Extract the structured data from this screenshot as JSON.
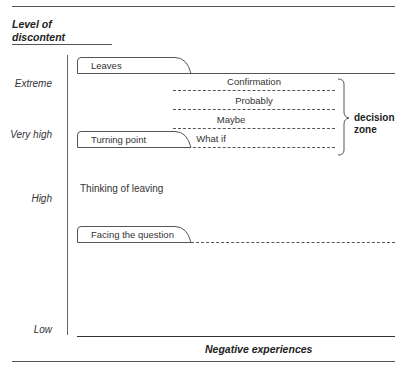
{
  "diagram": {
    "y_axis_title": [
      "Level of",
      "discontent"
    ],
    "x_axis_title": "Negative experiences",
    "y_levels": [
      "Extreme",
      "Very high",
      "High",
      "Low"
    ],
    "stages": [
      {
        "label": "Leaves",
        "line": "solid"
      },
      {
        "label": "Turning point",
        "line": "none"
      },
      {
        "label": "Facing the question",
        "line": "dashed"
      }
    ],
    "decision_steps": [
      "Confirmation",
      "Probably",
      "Maybe",
      "What if"
    ],
    "decision_zone_label": [
      "decision",
      "zone"
    ],
    "annotation": "Thinking of leaving"
  },
  "colors": {
    "line": "#555555",
    "text": "#222222"
  }
}
